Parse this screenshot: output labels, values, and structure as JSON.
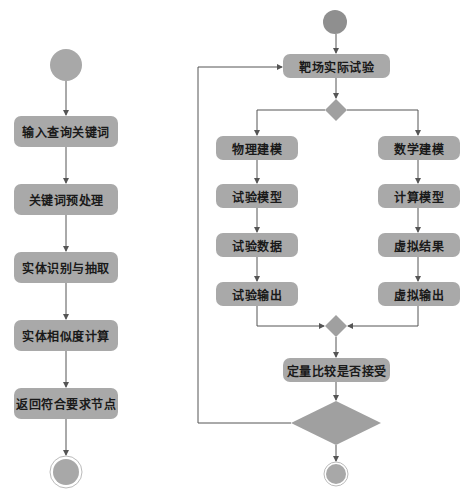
{
  "left_flow": {
    "nodes": [
      {
        "label": "输入查询关键词"
      },
      {
        "label": "关键词预处理"
      },
      {
        "label": "实体识别与抽取"
      },
      {
        "label": "实体相似度计算"
      },
      {
        "label": "返回符合要求节点"
      }
    ]
  },
  "right_flow": {
    "top": {
      "label": "靶场实际试验"
    },
    "physical_branch": [
      {
        "label": "物理建模"
      },
      {
        "label": "试验模型"
      },
      {
        "label": "试验数据"
      },
      {
        "label": "试验输出"
      }
    ],
    "math_branch": [
      {
        "label": "数学建模"
      },
      {
        "label": "计算模型"
      },
      {
        "label": "虚拟结果"
      },
      {
        "label": "虚拟输出"
      }
    ],
    "compare": {
      "label": "定量比较是否接受"
    }
  },
  "colors": {
    "node_fill": "#a9a9a9",
    "start_fill": "#9a9a9a",
    "line": "#555555"
  }
}
